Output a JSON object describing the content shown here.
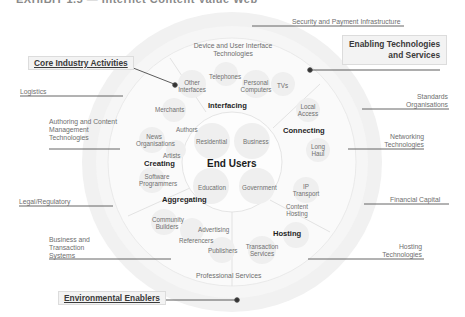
{
  "title": "EXHIBIT 1.5 — Internet Content Value Web",
  "center": {
    "title": "End Users",
    "segments": [
      "Residential",
      "Business",
      "Education",
      "Government"
    ]
  },
  "core_activities": [
    {
      "name": "Interfacing",
      "players": [
        "Other Interfaces",
        "Telephones",
        "Personal Computers",
        "TVs"
      ]
    },
    {
      "name": "Connecting",
      "players": [
        "Local Access",
        "Long Haul",
        "IP Transport"
      ]
    },
    {
      "name": "Hosting",
      "players": [
        "Content Hosting",
        "Transaction Services"
      ]
    },
    {
      "name": "Aggregating",
      "players": [
        "Community Builders",
        "Advertising",
        "Referencers",
        "Publishers"
      ]
    },
    {
      "name": "Creating",
      "players": [
        "Merchants",
        "Authors",
        "News Organisations",
        "Artists",
        "Software Programmers"
      ]
    }
  ],
  "enabling_technologies": {
    "top": "Device and User Interface Technologies",
    "bottom": "Professional Services"
  },
  "callouts": {
    "core_industry": "Core Industry Activities",
    "enabling": "Enabling Technologies and Services",
    "enabling_line1": "Enabling Technologies",
    "enabling_line2": "and Services",
    "environmental": "Environmental Enablers"
  },
  "external_labels": {
    "left": [
      "Logistics",
      "Authoring and Content Management Technologies",
      "Legal/Regulatory",
      "Business and Transaction Systems"
    ],
    "right": [
      "Security and Payment Infrastructure",
      "Standards Organisations",
      "Networking Technologies",
      "Financial Capital",
      "Hosting Technologies"
    ]
  },
  "colors": {
    "outer_ring": "#f0f0f0",
    "middle_ring": "#f7f7f7",
    "inner_ring": "#fbfbfb",
    "bubble": "#eeeeee",
    "line": "#555555",
    "divider": "#d8d8d8"
  }
}
